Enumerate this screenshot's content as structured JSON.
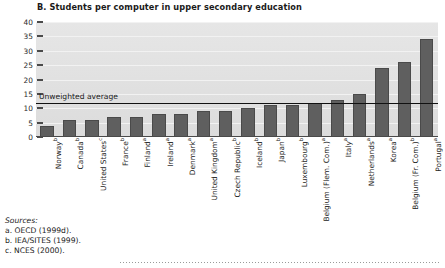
{
  "chart_data": {
    "type": "bar",
    "title": "B. Students per computer in upper secondary education",
    "xlabel": "",
    "ylabel": "",
    "ylim": [
      0,
      40
    ],
    "yticks": [
      0,
      5,
      10,
      15,
      20,
      25,
      30,
      35,
      40
    ],
    "grid": true,
    "legend": "none",
    "categories": [
      "Norway",
      "Canada",
      "United States",
      "France",
      "Finland",
      "Ireland",
      "Denmark",
      "United Kingdom",
      "Czech Republic",
      "Iceland",
      "Japan",
      "Luxembourg",
      "Belgium (Flem. Com.)",
      "Italy",
      "Netherlands",
      "Korea",
      "Belgium (Fr. Com.)",
      "Portugal"
    ],
    "category_notes": [
      "b",
      "b",
      "c",
      "b",
      "a",
      "a",
      "a",
      "a",
      "b",
      "b",
      "b",
      "b",
      "a",
      "a",
      "a",
      "a",
      "b",
      "a"
    ],
    "values": [
      4,
      6,
      6,
      7,
      7,
      8,
      8,
      9,
      9,
      10,
      11,
      11,
      12,
      13,
      15,
      24,
      26,
      34
    ],
    "annotations": [
      {
        "label": "Unweighted average",
        "type": "hline",
        "value": 12
      }
    ]
  },
  "sources": {
    "heading": "Sources:",
    "items": [
      "a. OECD (1999d).",
      "b. IEA/SITES (1999).",
      "c. NCES (2000)."
    ]
  },
  "colors": {
    "bar": "#5f5f5f",
    "plot_background": "#e2e2e2",
    "average_line": "#111111",
    "axis": "#4a4a4a"
  }
}
